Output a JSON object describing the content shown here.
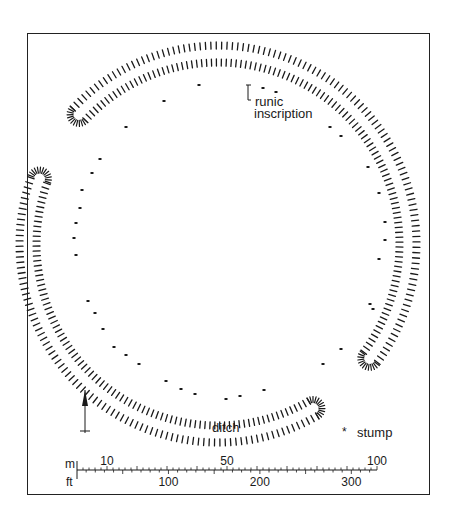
{
  "figure": {
    "type": "archaeological site plan",
    "frame": {
      "x": 27,
      "y": 33,
      "width": 403,
      "height": 462
    }
  },
  "ring": {
    "center": [
      218,
      244
    ],
    "outer_radius": 202,
    "inner_radius": 178,
    "segments": [
      {
        "name": "top-ditch-segment",
        "start_angle_deg": 223,
        "end_angle_deg": 397
      },
      {
        "name": "lower-ditch-segment",
        "start_angle_deg": 60,
        "end_angle_deg": 200
      }
    ],
    "color": "#1a1a1a"
  },
  "stumps": {
    "radius": 155,
    "center": [
      229,
      243
    ],
    "points": [
      [
        199,
        85
      ],
      [
        164,
        101
      ],
      [
        126,
        127
      ],
      [
        100,
        159
      ],
      [
        92,
        173
      ],
      [
        82,
        190
      ],
      [
        80,
        208
      ],
      [
        76,
        223
      ],
      [
        74,
        238
      ],
      [
        76,
        255
      ],
      [
        88,
        301
      ],
      [
        95,
        313
      ],
      [
        103,
        329
      ],
      [
        114,
        347
      ],
      [
        126,
        355
      ],
      [
        139,
        364
      ],
      [
        166,
        381
      ],
      [
        181,
        389
      ],
      [
        195,
        394
      ],
      [
        226,
        399
      ],
      [
        240,
        396
      ],
      [
        264,
        390
      ],
      [
        323,
        364
      ],
      [
        341,
        349
      ],
      [
        370,
        304
      ],
      [
        373,
        309
      ],
      [
        379,
        259
      ],
      [
        385,
        240
      ],
      [
        385,
        222
      ],
      [
        379,
        193
      ],
      [
        368,
        167
      ],
      [
        341,
        136
      ],
      [
        330,
        127
      ],
      [
        263,
        88
      ],
      [
        276,
        92
      ]
    ]
  },
  "annotations": {
    "runic_inscription": {
      "line1": "runic",
      "line2": "inscription",
      "marker": [
        248,
        85
      ]
    },
    "ditch_label": "ditch",
    "legend": {
      "symbol": "*",
      "label": "stump"
    }
  },
  "north_arrow": {
    "label": "north-arrow",
    "x": 85,
    "y_top": 390,
    "y_bottom": 433
  },
  "scale_bar": {
    "unit_top": "m",
    "unit_bottom": "ft",
    "x_start": 77,
    "x_end": 377,
    "y": 470,
    "m_labels": [
      {
        "value": "10",
        "m": 10
      },
      {
        "value": "50",
        "m": 50
      },
      {
        "value": "100",
        "m": 100
      }
    ],
    "ft_labels": [
      {
        "value": "100",
        "ft": 100
      },
      {
        "value": "200",
        "ft": 200
      },
      {
        "value": "300",
        "ft": 300
      }
    ],
    "m_max": 100
  }
}
